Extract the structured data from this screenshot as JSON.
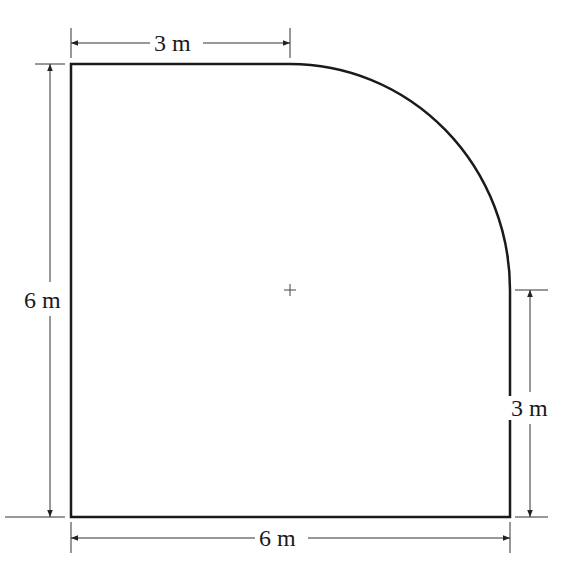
{
  "figure": {
    "type": "floor-plan-shape"
  },
  "colors": {
    "outline": "#1a1a1a",
    "dimension_line": "#333333",
    "background": "#ffffff"
  },
  "shape": {
    "width_label": "6 m",
    "height_label": "6 m",
    "top_straight_label": "3 m",
    "right_straight_label": "3 m",
    "arc_radius_m": 3
  },
  "dimensions": {
    "top": {
      "label": "3 m"
    },
    "left": {
      "label": "6 m"
    },
    "right": {
      "label": "3 m"
    },
    "bottom": {
      "label": "6 m"
    }
  },
  "center_mark": {
    "symbol": "+"
  }
}
